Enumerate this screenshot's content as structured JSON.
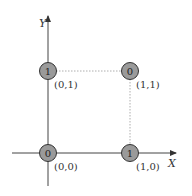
{
  "diagram": {
    "axes": {
      "x_label": "X",
      "y_label": "Y"
    },
    "points": [
      {
        "coord": "(0,0)",
        "value": "0",
        "cx": 48,
        "cy": 153
      },
      {
        "coord": "(0,1)",
        "value": "1",
        "cx": 48,
        "cy": 71
      },
      {
        "coord": "(1,1)",
        "value": "0",
        "cx": 130,
        "cy": 71
      },
      {
        "coord": "(1,0)",
        "value": "1",
        "cx": 130,
        "cy": 153
      }
    ],
    "colors": {
      "node_fill": "#9a9a9a",
      "node_stroke": "#333333",
      "axis": "#444444",
      "guide": "#999999"
    }
  }
}
